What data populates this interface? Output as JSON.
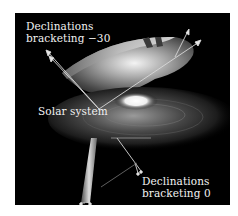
{
  "figure": {
    "labels": {
      "upper_wedge_line1": "Declinations",
      "upper_wedge_line2": "bracketing −30",
      "solar_system": "Solar system",
      "lower_wedge_line1": "Declinations",
      "lower_wedge_line2": "bracketing 0"
    },
    "colors": {
      "background": "#000000",
      "text": "#f2f2f2",
      "page": "#ffffff",
      "lines": "#d8d8d8"
    }
  }
}
